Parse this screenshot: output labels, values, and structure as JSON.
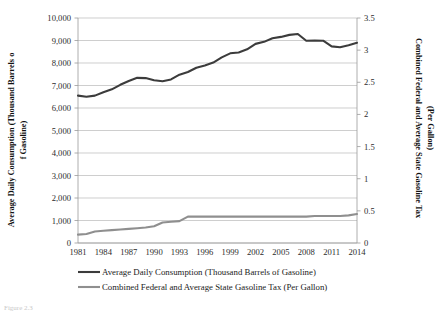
{
  "figure": {
    "caption_partial": "Figure 2.3"
  },
  "chart_data": {
    "type": "line",
    "title": "",
    "xlabel": "",
    "ylabel": "Average Daily Consumption (Thousand Barrels of Gasoline)",
    "y2label": "Combined Federal and Average State Gasoline Tax (Per Gallon)",
    "grid": true,
    "legend_position": "bottom",
    "ylim": [
      0,
      10000
    ],
    "y2lim": [
      0,
      3.5
    ],
    "xlim": [
      1981,
      2014
    ],
    "yticks": [
      0,
      1000,
      2000,
      3000,
      4000,
      5000,
      6000,
      7000,
      8000,
      9000,
      10000
    ],
    "ytick_labels": [
      "0",
      "1,000",
      "2,000",
      "3,000",
      "4,000",
      "5,000",
      "6,000",
      "7,000",
      "8,000",
      "9,000",
      "10,000"
    ],
    "y2ticks": [
      0,
      0.5,
      1,
      1.5,
      2,
      2.5,
      3,
      3.5
    ],
    "y2tick_labels": [
      "0",
      "0.5",
      "1",
      "1.5",
      "2",
      "2.5",
      "3",
      "3.5"
    ],
    "xticks": [
      1981,
      1984,
      1987,
      1990,
      1993,
      1996,
      1999,
      2002,
      2005,
      2008,
      2011,
      2014
    ],
    "xtick_labels": [
      "1981",
      "1984",
      "1987",
      "1990",
      "1993",
      "1996",
      "1999",
      "2002",
      "2005",
      "2008",
      "2011",
      "2014"
    ],
    "x": [
      1981,
      1982,
      1983,
      1984,
      1985,
      1986,
      1987,
      1988,
      1989,
      1990,
      1991,
      1992,
      1993,
      1994,
      1995,
      1996,
      1997,
      1998,
      1999,
      2000,
      2001,
      2002,
      2003,
      2004,
      2005,
      2006,
      2007,
      2008,
      2009,
      2010,
      2011,
      2012,
      2013,
      2014
    ],
    "series": [
      {
        "name": "Average Daily Consumption (Thousand Barrels of Gasoline)",
        "axis": "left",
        "color": "#3c3c3c",
        "width": 2.1,
        "values": [
          6550,
          6500,
          6550,
          6700,
          6830,
          7030,
          7200,
          7340,
          7330,
          7230,
          7190,
          7270,
          7480,
          7600,
          7790,
          7890,
          8020,
          8250,
          8430,
          8470,
          8610,
          8850,
          8940,
          9100,
          9160,
          9250,
          9290,
          8990,
          9000,
          8990,
          8740,
          8700,
          8790,
          8900
        ]
      },
      {
        "name": "Combined Federal and Average State Gasoline Tax (Per Gallon)",
        "axis": "right",
        "color": "#8f8f8f",
        "width": 2.1,
        "values": [
          0.13,
          0.14,
          0.18,
          0.19,
          0.2,
          0.21,
          0.22,
          0.23,
          0.24,
          0.26,
          0.32,
          0.33,
          0.34,
          0.41,
          0.41,
          0.41,
          0.41,
          0.41,
          0.41,
          0.41,
          0.41,
          0.41,
          0.41,
          0.41,
          0.41,
          0.41,
          0.41,
          0.41,
          0.42,
          0.42,
          0.42,
          0.42,
          0.43,
          0.45
        ]
      }
    ],
    "legend": [
      {
        "label": "Average Daily Consumption (Thousand Barrels of Gasoline)",
        "color": "#3c3c3c"
      },
      {
        "label": "Combined Federal and Average State Gasoline Tax (Per Gallon)",
        "color": "#8f8f8f"
      }
    ]
  }
}
